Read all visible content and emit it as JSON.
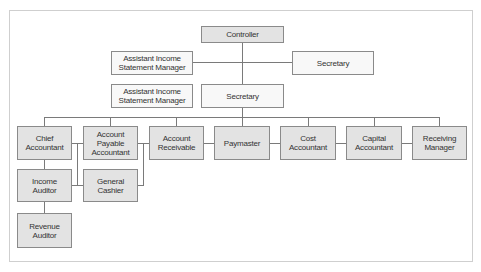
{
  "diagram": {
    "type": "org-chart",
    "colors": {
      "box_gray": "#e3e3e3",
      "box_light": "#f8f8f8",
      "border": "#8a8a8a",
      "line": "#7a7a7a",
      "frame": "#cfcfcf"
    },
    "nodes": {
      "controller": "Controller",
      "assistant_top": "Assistant Income\nStatement Manager",
      "secretary_right": "Secretary",
      "assistant_mid": "Assistant Income\nStatement Manager",
      "secretary_center": "Secretary",
      "chief_accountant": "Chief\nAccountant",
      "account_payable_accountant": "Account\nPayable\nAccountant",
      "account_receivable": "Account\nReceivable",
      "paymaster": "Paymaster",
      "cost_accountant": "Cost\nAccountant",
      "capital_accountant": "Capital\nAccountant",
      "receiving_manager": "Receiving\nManager",
      "income_auditor": "Income\nAuditor",
      "general_cashier": "General\nCashier",
      "revenue_auditor": "Revenue\nAuditor"
    },
    "edges": [
      [
        "controller",
        "secretary_center"
      ],
      [
        "controller",
        "assistant_top"
      ],
      [
        "controller",
        "secretary_right"
      ],
      [
        "secretary_center",
        "chief_accountant"
      ],
      [
        "secretary_center",
        "account_payable_accountant"
      ],
      [
        "secretary_center",
        "account_receivable"
      ],
      [
        "secretary_center",
        "paymaster"
      ],
      [
        "secretary_center",
        "cost_accountant"
      ],
      [
        "secretary_center",
        "capital_accountant"
      ],
      [
        "secretary_center",
        "receiving_manager"
      ],
      [
        "chief_accountant",
        "income_auditor"
      ],
      [
        "income_auditor",
        "revenue_auditor"
      ],
      [
        "chief_accountant",
        "general_cashier"
      ],
      [
        "account_payable_accountant",
        "general_cashier"
      ]
    ]
  }
}
